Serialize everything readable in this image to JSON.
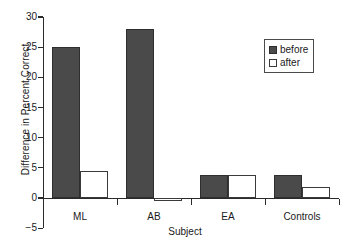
{
  "chart_data": {
    "type": "bar",
    "title": "",
    "xlabel": "Subject",
    "ylabel": "Difference in Percent Correct",
    "categories": [
      "ML",
      "AB",
      "EA",
      "Controls"
    ],
    "series": [
      {
        "name": "before",
        "values": [
          25,
          28,
          3.8,
          3.8
        ],
        "color": "#4a4a4a",
        "fill": "solid"
      },
      {
        "name": "after",
        "values": [
          4.5,
          -0.5,
          3.8,
          1.8
        ],
        "color": "#ffffff",
        "fill": "hollow"
      }
    ],
    "ylim": [
      -5,
      30
    ],
    "yticks": [
      -5,
      0,
      5,
      10,
      15,
      20,
      25,
      30
    ],
    "ytick_labels": [
      "−5",
      "0",
      "5",
      "10",
      "15",
      "20",
      "25",
      "30"
    ],
    "grid": false,
    "legend_position": "top-right",
    "legend_entries": [
      "before",
      "after"
    ]
  }
}
